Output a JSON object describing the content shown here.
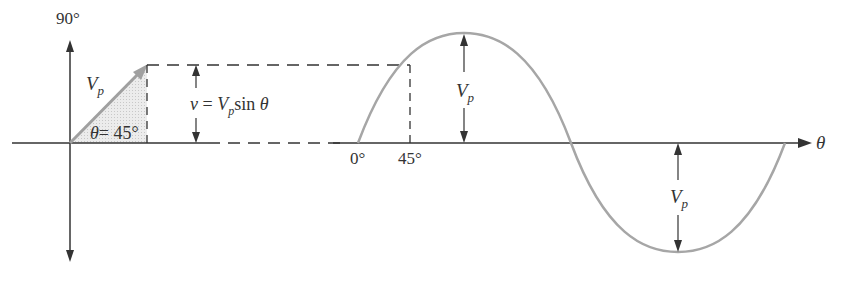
{
  "diagram": {
    "phasor": {
      "vertical_label": "90°",
      "magnitude_label": "V",
      "magnitude_subscript": "p",
      "angle_label": "θ= 45°",
      "angle_symbol": "θ",
      "angle_value": "= 45°"
    },
    "projection": {
      "equation_v": "v",
      "equation_eq": " = ",
      "equation_V": "V",
      "equation_sub": "p",
      "equation_sin": "sin ",
      "equation_theta": "θ"
    },
    "waveform": {
      "tick_0": "0°",
      "tick_45": "45°",
      "axis_label": "θ",
      "peak_label_V": "V",
      "peak_label_sub": "p",
      "trough_label_V": "V",
      "trough_label_sub": "p"
    },
    "colors": {
      "axis": "#333333",
      "wave": "#a6a6a6",
      "phasor": "#a0a0a0",
      "shade": "#e6e6e6",
      "text": "#333333"
    }
  }
}
